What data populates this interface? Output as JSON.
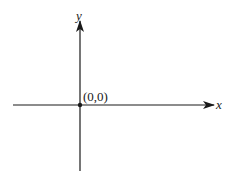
{
  "diagram": {
    "type": "coordinate-axes",
    "x_axis": {
      "label": "x"
    },
    "y_axis": {
      "label": "y"
    },
    "origin": {
      "label": "(0,0)"
    },
    "colors": {
      "axis": "#1a1a1a",
      "background": "#ffffff"
    }
  }
}
